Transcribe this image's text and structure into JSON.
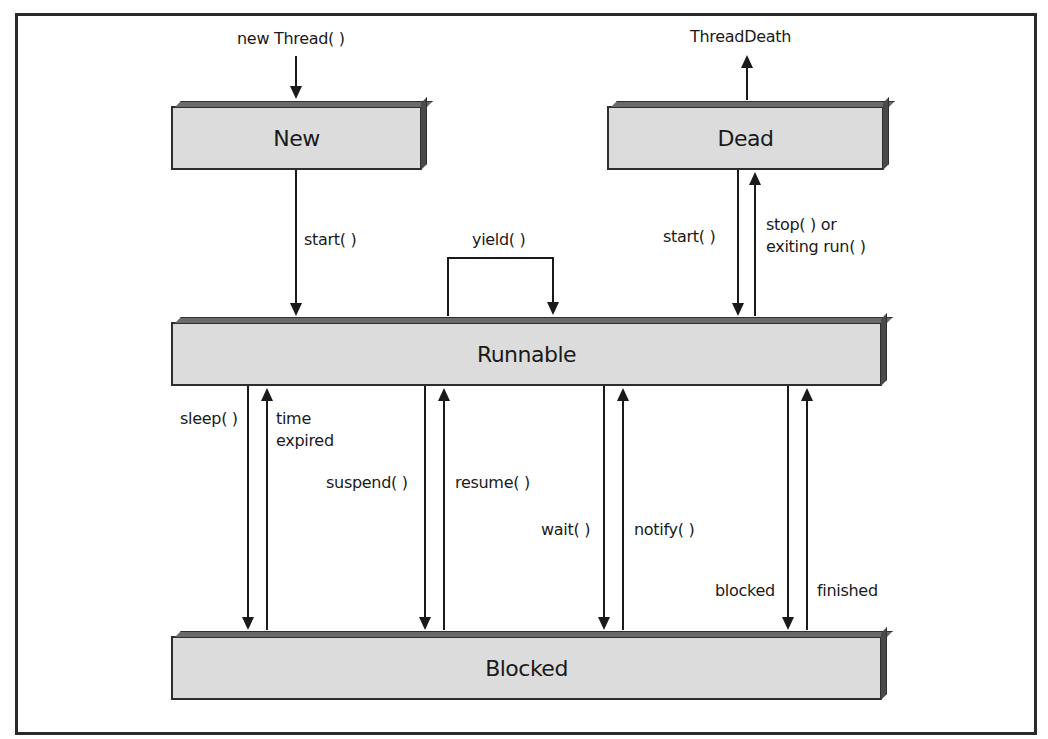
{
  "diagram": {
    "states": {
      "new": "New",
      "dead": "Dead",
      "runnable": "Runnable",
      "blocked": "Blocked"
    },
    "transitions": {
      "new_thread": "new Thread( )",
      "thread_death": "ThreadDeath",
      "start_new": "start( )",
      "yield": "yield( )",
      "start_dead": "start( )",
      "stop": "stop( ) or\nexiting run( )",
      "sleep": "sleep( )",
      "time_expired": "time\nexpired",
      "suspend": "suspend( )",
      "resume": "resume( )",
      "wait": "wait( )",
      "notify": "notify( )",
      "blocked": "blocked",
      "finished": "finished"
    },
    "colors": {
      "box_fill": "#dcdcdc",
      "line": "#1a1a1a"
    }
  }
}
